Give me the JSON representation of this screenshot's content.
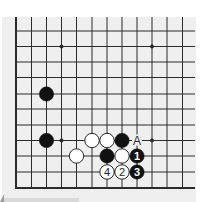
{
  "diagram": {
    "type": "go-board-fragment",
    "corner": "bottom-left",
    "grid": {
      "columns_x": [
        16,
        31.5,
        46.5,
        61.5,
        76.5,
        92,
        107,
        122,
        137,
        152,
        167,
        182.5
      ],
      "rows_y": [
        31,
        46.5,
        62,
        77.5,
        94,
        109,
        125,
        140.5,
        156,
        172,
        188
      ],
      "right_extent": 195,
      "top_extent": 17
    },
    "colors": {
      "board": "#efefef",
      "line": "#2b2b2b",
      "black_stone": "#111111",
      "white_stone": "#ffffff",
      "label_on_white": "#222222",
      "label_on_black": "#ffffff"
    },
    "star_points": [
      {
        "col": 3,
        "row": 1
      },
      {
        "col": 9,
        "row": 1
      },
      {
        "col": 3,
        "row": 7
      },
      {
        "col": 9,
        "row": 7
      }
    ],
    "stones": [
      {
        "color": "black",
        "col": 2,
        "row": 4,
        "label": ""
      },
      {
        "color": "black",
        "col": 2,
        "row": 7,
        "label": ""
      },
      {
        "color": "white",
        "col": 5,
        "row": 7,
        "label": ""
      },
      {
        "color": "white",
        "col": 6,
        "row": 7,
        "label": ""
      },
      {
        "color": "black",
        "col": 7,
        "row": 7,
        "label": ""
      },
      {
        "color": "white",
        "col": 4,
        "row": 8,
        "label": ""
      },
      {
        "color": "black",
        "col": 6,
        "row": 8,
        "label": ""
      },
      {
        "color": "white",
        "col": 7,
        "row": 8,
        "label": ""
      },
      {
        "color": "black",
        "col": 8,
        "row": 8,
        "label": "1"
      },
      {
        "color": "white",
        "col": 7,
        "row": 9,
        "label": "2"
      },
      {
        "color": "black",
        "col": 8,
        "row": 9,
        "label": "3"
      },
      {
        "color": "white",
        "col": 6,
        "row": 9,
        "label": "4"
      }
    ],
    "annotations": [
      {
        "text": "A",
        "col": 8,
        "row": 7
      }
    ]
  }
}
